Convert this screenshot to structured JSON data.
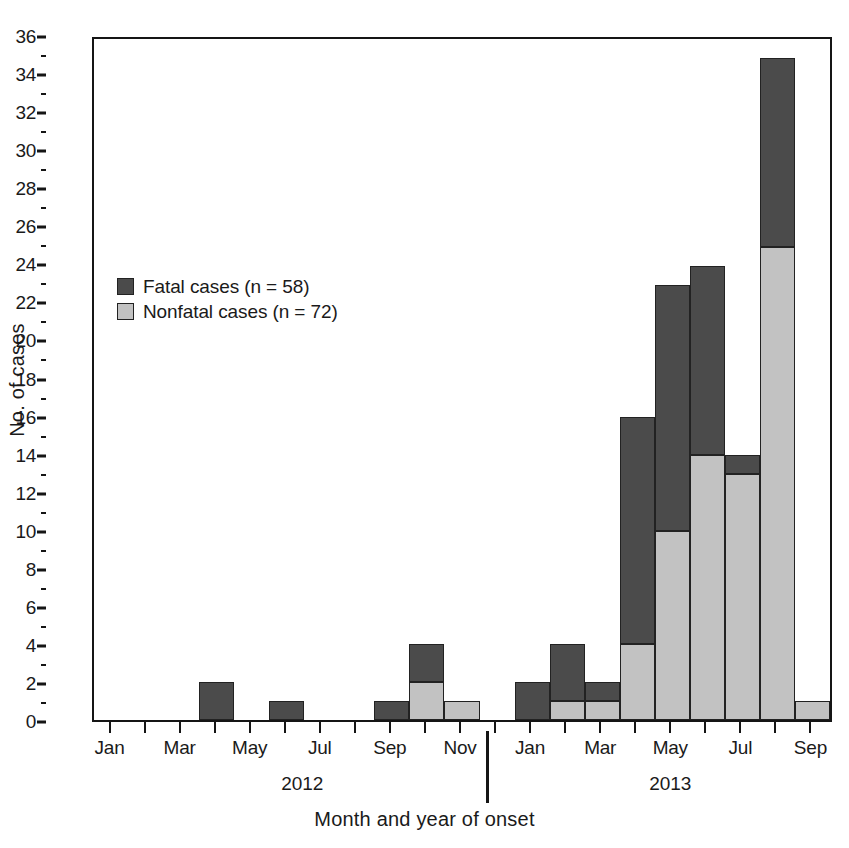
{
  "chart_data": {
    "type": "bar",
    "stacked": true,
    "title": "",
    "xlabel": "Month and year of onset",
    "ylabel": "No. of cases",
    "ylim": [
      0,
      36
    ],
    "ytick_step": 2,
    "yminor_step": 1,
    "grid": false,
    "legend_position": "upper-left-inside",
    "ytick_labels": [
      "0",
      "2",
      "4",
      "6",
      "8",
      "10",
      "12",
      "14",
      "16",
      "18",
      "20",
      "22",
      "24",
      "26",
      "28",
      "30",
      "32",
      "34",
      "36"
    ],
    "categories": [
      "Jan 2012",
      "Feb 2012",
      "Mar 2012",
      "Apr 2012",
      "May 2012",
      "Jun 2012",
      "Jul 2012",
      "Aug 2012",
      "Sep 2012",
      "Oct 2012",
      "Nov 2012",
      "Dec 2012",
      "Jan 2013",
      "Feb 2013",
      "Mar 2013",
      "Apr 2013",
      "May 2013",
      "Jun 2013",
      "Jul 2013",
      "Aug 2013",
      "Sep 2013"
    ],
    "xtick_labels": [
      "Jan",
      "",
      "Mar",
      "",
      "May",
      "",
      "Jul",
      "",
      "Sep",
      "",
      "Nov",
      "",
      "Jan",
      "",
      "Mar",
      "",
      "May",
      "",
      "Jul",
      "",
      "Sep"
    ],
    "group_labels": [
      "2012",
      "2013"
    ],
    "series": [
      {
        "name": "Nonfatal cases (n = 72)",
        "color": "#c2c2c2",
        "values": [
          0,
          0,
          0,
          0,
          0,
          0,
          0,
          0,
          0,
          2,
          1,
          0,
          0,
          1,
          1,
          4,
          10,
          14,
          13,
          25,
          1
        ]
      },
      {
        "name": "Fatal cases (n = 58)",
        "color": "#4b4b4b",
        "values": [
          0,
          0,
          0,
          2,
          0,
          1,
          0,
          0,
          1,
          2,
          0,
          0,
          2,
          3,
          1,
          12,
          13,
          10,
          1,
          10,
          0
        ]
      }
    ],
    "totals": [
      0,
      0,
      0,
      2,
      0,
      1,
      0,
      0,
      1,
      4,
      1,
      0,
      2,
      4,
      2,
      16,
      23,
      24,
      14,
      35,
      1
    ]
  },
  "legend": {
    "items": [
      {
        "label": "Fatal cases (n = 58)",
        "swatch": "fatal"
      },
      {
        "label": "Nonfatal cases (n = 72)",
        "swatch": "nonfatal"
      }
    ]
  },
  "axes": {
    "x_title": "Month and year of onset",
    "y_title": "No. of cases"
  },
  "colors": {
    "fatal": "#4b4b4b",
    "nonfatal": "#c2c2c2",
    "axis": "#151515",
    "background": "#ffffff"
  }
}
